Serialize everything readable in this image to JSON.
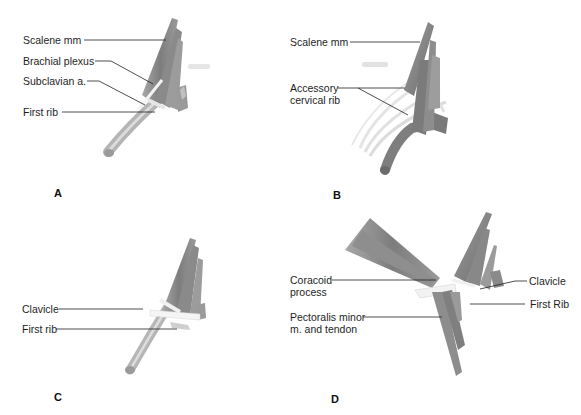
{
  "figure": {
    "colors": {
      "muscle": "#8c8c8c",
      "muscle_light": "#b5b5b5",
      "bone": "#ececec",
      "leader": "#222222",
      "text": "#1e1e1e"
    },
    "panels": [
      {
        "letter": "A",
        "labels": [
          {
            "text": "Scalene mm"
          },
          {
            "text": "Brachial plexus"
          },
          {
            "text": "Subclavian a."
          },
          {
            "text": "First rib"
          }
        ]
      },
      {
        "letter": "B",
        "labels": [
          {
            "text": "Scalene mm"
          },
          {
            "text": "Accessory cervical rib"
          }
        ]
      },
      {
        "letter": "C",
        "labels": [
          {
            "text": "Clavicle"
          },
          {
            "text": "First rib"
          }
        ]
      },
      {
        "letter": "D",
        "labels": [
          {
            "text": "Coracoid process"
          },
          {
            "text": "Pectoralis minor m. and tendon"
          },
          {
            "text": "Clavicle"
          },
          {
            "text": "First Rib"
          }
        ]
      }
    ]
  }
}
